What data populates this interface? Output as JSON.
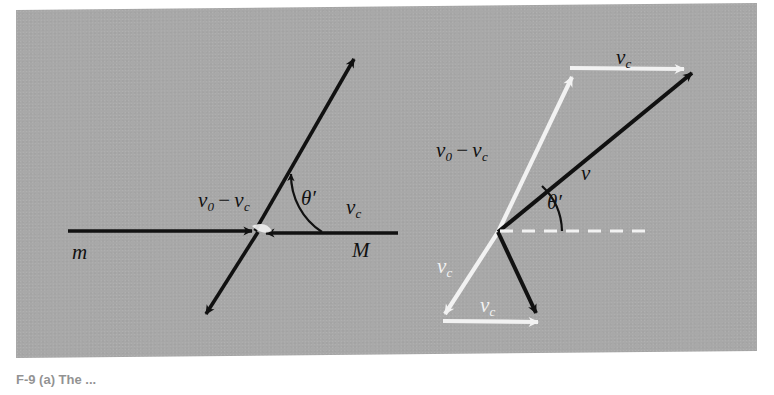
{
  "figure": {
    "panel_color": "#a8a8a8",
    "black": "#111111",
    "white": "#f2f2f2",
    "caption": "F-9   (a) The ..."
  },
  "left_diagram": {
    "name": "lab-frame-collision-diagram",
    "labels": {
      "incoming_v": "v",
      "incoming_v_sub": "0",
      "minus": "−",
      "incoming_vc": "v",
      "incoming_vc_sub": "c",
      "mass_m": "m",
      "target_vc": "v",
      "target_vc_sub": "c",
      "mass_M": "M",
      "theta": "θ′"
    }
  },
  "right_diagram": {
    "name": "velocity-addition-diagram",
    "labels": {
      "vc_top": "v",
      "vc_top_sub": "c",
      "v0_minus_vc_v": "v",
      "v0_minus_vc_sub": "0",
      "minus": "−",
      "v0_minus_vc_vc": "v",
      "v0_minus_vc_vc_sub": "c",
      "v_resultant": "v",
      "theta": "θ′",
      "vc_left": "v",
      "vc_left_sub": "c",
      "vc_bottom": "v",
      "vc_bottom_sub": "c"
    }
  }
}
